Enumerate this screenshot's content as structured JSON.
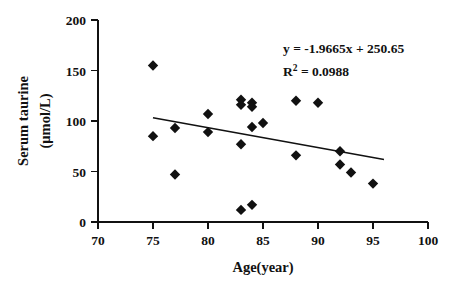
{
  "chart_data": {
    "type": "scatter",
    "title": "",
    "xlabel": "Age(year)",
    "ylabel": "Serum taurine (μmol/L)",
    "ylabel_line1": "Serum taurine",
    "ylabel_line2": "(μmol/L)",
    "xlim": [
      70,
      100
    ],
    "ylim": [
      0,
      200
    ],
    "xticks": [
      70,
      75,
      80,
      85,
      90,
      95,
      100
    ],
    "yticks": [
      0,
      50,
      100,
      150,
      200
    ],
    "xtick_labels": [
      "70",
      "75",
      "80",
      "85",
      "90",
      "95",
      "100"
    ],
    "ytick_labels": [
      "0",
      "50",
      "100",
      "150",
      "200"
    ],
    "grid": false,
    "legend": null,
    "marker_shape": "filled-diamond",
    "marker_color": "#111111",
    "series": [
      {
        "name": "Serum taurine vs Age",
        "points": [
          {
            "x": 75,
            "y": 155
          },
          {
            "x": 75,
            "y": 85
          },
          {
            "x": 77,
            "y": 93
          },
          {
            "x": 77,
            "y": 47
          },
          {
            "x": 80,
            "y": 107
          },
          {
            "x": 80,
            "y": 89
          },
          {
            "x": 83,
            "y": 121
          },
          {
            "x": 83,
            "y": 116
          },
          {
            "x": 83,
            "y": 77
          },
          {
            "x": 83,
            "y": 12
          },
          {
            "x": 84,
            "y": 118
          },
          {
            "x": 84,
            "y": 114
          },
          {
            "x": 84,
            "y": 94
          },
          {
            "x": 84,
            "y": 17
          },
          {
            "x": 85,
            "y": 98
          },
          {
            "x": 88,
            "y": 120
          },
          {
            "x": 88,
            "y": 66
          },
          {
            "x": 90,
            "y": 118
          },
          {
            "x": 92,
            "y": 70
          },
          {
            "x": 92,
            "y": 57
          },
          {
            "x": 93,
            "y": 49
          },
          {
            "x": 95,
            "y": 38
          }
        ]
      }
    ],
    "trendline": {
      "slope": -1.9665,
      "intercept": 250.65,
      "x_start": 75,
      "x_end": 96,
      "equation_label": "y = -1.9665x + 250.65",
      "r2_base": "R",
      "r2_exponent": "2",
      "r2_label": " = 0.0988",
      "r2_value": 0.0988
    },
    "annotations": [
      {
        "name": "regression-equation",
        "text": "y = -1.9665x + 250.65"
      },
      {
        "name": "r-squared",
        "text": "R2 = 0.0988"
      }
    ]
  }
}
